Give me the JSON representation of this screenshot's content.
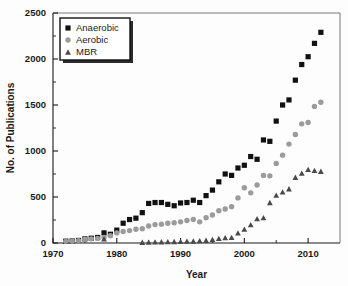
{
  "chart_data": {
    "type": "scatter",
    "title": "",
    "xlabel": "Year",
    "ylabel": "No. of Publications",
    "xlim": [
      1970,
      2015
    ],
    "ylim": [
      0,
      2500
    ],
    "xticks": [
      1970,
      1980,
      1990,
      2000,
      2010
    ],
    "yticks": [
      0,
      500,
      1000,
      1500,
      2000,
      2500
    ],
    "xtick_labels": [
      "1970",
      "1980",
      "1990",
      "2000",
      "2010"
    ],
    "ytick_labels": [
      "0",
      "500",
      "1000",
      "1500",
      "2000",
      "2500"
    ],
    "grid": false,
    "legend_position": "top-left",
    "minor_ticks": true,
    "series": [
      {
        "name": "Anaerobic",
        "marker": "square",
        "color": "#111111",
        "x": [
          1972,
          1973,
          1974,
          1975,
          1976,
          1977,
          1978,
          1979,
          1980,
          1981,
          1982,
          1983,
          1984,
          1985,
          1986,
          1987,
          1988,
          1989,
          1990,
          1991,
          1992,
          1993,
          1994,
          1995,
          1996,
          1997,
          1998,
          1999,
          2000,
          2001,
          2002,
          2003,
          2004,
          2005,
          2006,
          2007,
          2008,
          2009,
          2010,
          2011,
          2012
        ],
        "values": [
          20,
          22,
          28,
          45,
          52,
          60,
          110,
          95,
          140,
          215,
          255,
          270,
          330,
          430,
          440,
          440,
          420,
          405,
          435,
          440,
          465,
          440,
          515,
          575,
          665,
          750,
          735,
          815,
          845,
          940,
          910,
          1120,
          1105,
          1325,
          1500,
          1555,
          1770,
          1940,
          2025,
          2170,
          2290
        ]
      },
      {
        "name": "Aerobic",
        "marker": "circle",
        "color": "#9b9b9b",
        "x": [
          1972,
          1973,
          1974,
          1975,
          1976,
          1977,
          1978,
          1979,
          1980,
          1981,
          1982,
          1983,
          1984,
          1985,
          1986,
          1987,
          1988,
          1989,
          1990,
          1991,
          1992,
          1993,
          1994,
          1995,
          1996,
          1997,
          1998,
          1999,
          2000,
          2001,
          2002,
          2003,
          2004,
          2005,
          2006,
          2007,
          2008,
          2009,
          2010,
          2011,
          2012
        ],
        "values": [
          18,
          20,
          25,
          40,
          45,
          50,
          60,
          80,
          110,
          125,
          135,
          150,
          155,
          185,
          200,
          205,
          215,
          220,
          230,
          245,
          255,
          230,
          275,
          305,
          350,
          370,
          395,
          490,
          600,
          545,
          630,
          735,
          730,
          865,
          955,
          1075,
          1180,
          1295,
          1310,
          1485,
          1530
        ]
      },
      {
        "name": "MBR",
        "marker": "triangle",
        "color": "#4a4a4a",
        "x": [
          1978,
          1984,
          1985,
          1986,
          1987,
          1988,
          1989,
          1990,
          1991,
          1992,
          1993,
          1994,
          1995,
          1996,
          1997,
          1998,
          1999,
          2000,
          2001,
          2002,
          2003,
          2004,
          2005,
          2006,
          2007,
          2008,
          2009,
          2010,
          2011,
          2012
        ],
        "values": [
          45,
          8,
          10,
          12,
          14,
          15,
          16,
          18,
          20,
          22,
          25,
          30,
          40,
          50,
          58,
          62,
          110,
          150,
          200,
          265,
          275,
          440,
          520,
          555,
          590,
          715,
          760,
          800,
          790,
          780
        ]
      }
    ]
  },
  "legend": {
    "entries": [
      {
        "label": "Anaerobic"
      },
      {
        "label": "Aerobic"
      },
      {
        "label": "MBR"
      }
    ]
  }
}
